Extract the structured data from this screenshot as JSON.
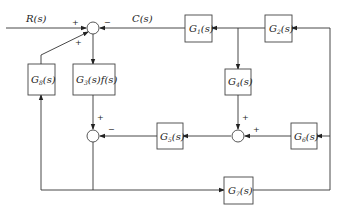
{
  "diagram": {
    "type": "control-system-block-diagram",
    "signals": {
      "input": "R(s)",
      "output": "C(s)"
    },
    "blocks": [
      {
        "id": "G1",
        "main": "G",
        "sub": "1",
        "tail": "(s)"
      },
      {
        "id": "G2",
        "main": "G",
        "sub": "2",
        "tail": "(s)"
      },
      {
        "id": "G3f",
        "main": "G",
        "sub": "3",
        "tail": "(s)f(s)"
      },
      {
        "id": "G4",
        "main": "G",
        "sub": "4",
        "tail": "(s)"
      },
      {
        "id": "G5",
        "main": "G",
        "sub": "5",
        "tail": "(s)"
      },
      {
        "id": "G6",
        "main": "G",
        "sub": "6",
        "tail": "(s)"
      },
      {
        "id": "G7",
        "main": "G",
        "sub": "7",
        "tail": "(s)"
      },
      {
        "id": "G8",
        "main": "G",
        "sub": "8",
        "tail": "(s)"
      }
    ],
    "junctions": {
      "top": {
        "signs": {
          "left": "+",
          "right": "−",
          "lower": "+"
        }
      },
      "lower_left": {
        "signs": {
          "top": "+",
          "right": "−"
        }
      },
      "lower_right": {
        "signs": {
          "top": "+",
          "right": "+"
        }
      }
    }
  }
}
